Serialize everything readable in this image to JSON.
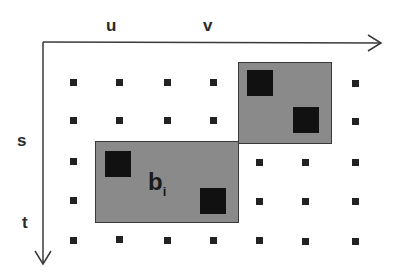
{
  "axes": {
    "horizontal": {
      "labels": [
        "u",
        "v"
      ],
      "direction": "right"
    },
    "vertical": {
      "labels": [
        "s",
        "t"
      ],
      "direction": "down"
    }
  },
  "grid": {
    "columns_x": [
      73,
      119,
      167,
      213,
      259,
      305,
      355
    ],
    "rows_y": [
      82,
      120,
      162,
      200,
      240
    ]
  },
  "blocks": [
    {
      "id": "bi",
      "label_main": "b",
      "label_sub": "i",
      "fill": "#8a8a8a"
    },
    {
      "id": "neighbor",
      "fill": "#8a8a8a"
    }
  ],
  "colors": {
    "axis": "#3a3a3a",
    "dot": "#222222",
    "block_fill": "#8a8a8a",
    "pixel": "#111111"
  }
}
